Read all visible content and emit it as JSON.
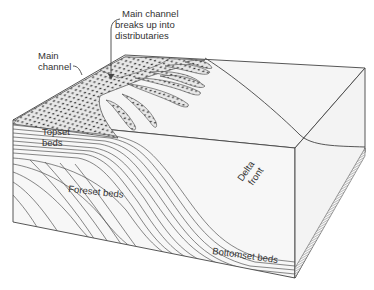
{
  "labels": {
    "distributaries": [
      "Main channel",
      "breaks up into",
      "distributaries"
    ],
    "main_channel": [
      "Main",
      "channel"
    ],
    "topset": [
      "Topset",
      "beds"
    ],
    "foreset": "Foreset beds",
    "delta_front": [
      "Delta",
      "front"
    ],
    "bottomset": "Bottomset beds"
  },
  "colors": {
    "background": "#ffffff",
    "surface": "#f4f4f4",
    "line": "#444444",
    "sediment": "#555555"
  }
}
